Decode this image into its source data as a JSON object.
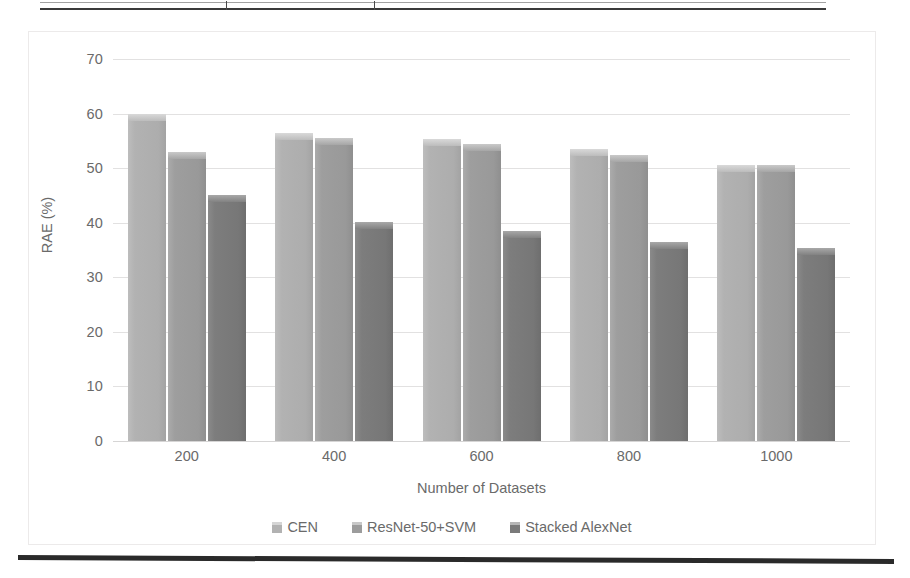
{
  "page": {
    "scan_artifacts": {
      "table_edge_name": "table-bottom-border",
      "bottom_rule_name": "horizontal-rule"
    }
  },
  "chart_data": {
    "type": "bar",
    "title": "",
    "subtitle": "",
    "xlabel": "Number of Datasets",
    "ylabel": "RAE (%)",
    "categories": [
      "200",
      "400",
      "600",
      "800",
      "1000"
    ],
    "series": [
      {
        "name": "CEN",
        "color": "#b2b2b2",
        "values": [
          60.0,
          56.5,
          55.3,
          53.5,
          50.5
        ]
      },
      {
        "name": "ResNet-50+SVM",
        "color": "#9c9c9c",
        "values": [
          53.0,
          55.5,
          54.5,
          52.5,
          50.5
        ]
      },
      {
        "name": "Stacked AlexNet",
        "color": "#7a7a7a",
        "values": [
          45.0,
          40.2,
          38.5,
          36.5,
          35.4
        ]
      }
    ],
    "ylim": [
      0,
      70
    ],
    "yticks": [
      0,
      10,
      20,
      30,
      40,
      50,
      60,
      70
    ],
    "ytick_labels": [
      "0",
      "10",
      "20",
      "30",
      "40",
      "50",
      "60",
      "70"
    ],
    "grid": "horizontal",
    "legend_position": "bottom"
  }
}
